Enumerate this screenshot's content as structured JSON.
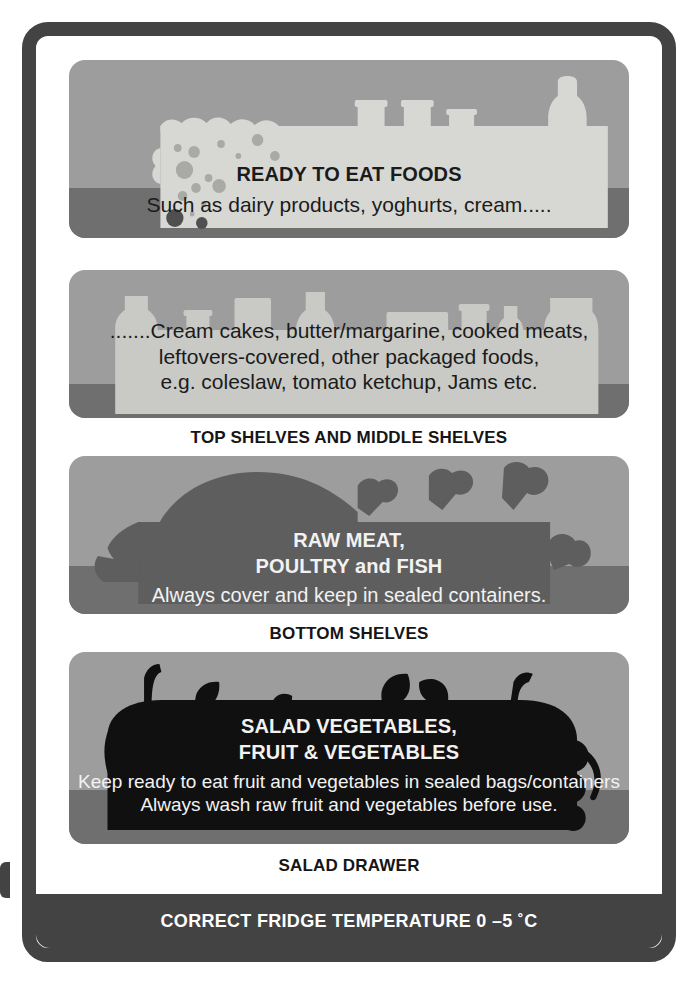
{
  "poster": {
    "title": "Fridge Food Storage Guide",
    "frame_color": "#434343",
    "panel_bg_color": "#9d9d9d",
    "panel_band_color": "#6f6f6f"
  },
  "shelves": [
    {
      "id": "ready-to-eat",
      "silhouette": "cheese-tubs-bottle",
      "silhouette_color": "#d7d8d4",
      "title": "READY TO EAT FOODS",
      "lines": [
        "Such as dairy products, yoghurts, cream....."
      ],
      "text_color": "#1b1b1b"
    },
    {
      "id": "top-middle-shelves",
      "silhouette": "bottles-jars-row",
      "silhouette_color": "#c9cac6",
      "title": "",
      "lines": [
        ".......Cream cakes, butter/margarine, cooked meats,",
        "leftovers-covered, other packaged foods,",
        "e.g. coleslaw, tomato ketchup, Jams etc."
      ],
      "text_color": "#1b1b1b",
      "caption": "TOP SHELVES AND MIDDLE SHELVES"
    },
    {
      "id": "raw-meat",
      "silhouette": "fish-and-meat-joints",
      "silhouette_color": "#5e5e5e",
      "title_lines": [
        "RAW MEAT,",
        "POULTRY and FISH"
      ],
      "lines": [
        "Always cover and keep in sealed containers."
      ],
      "text_color": "#f2f2f2",
      "caption": "BOTTOM SHELVES"
    },
    {
      "id": "salad-drawer",
      "silhouette": "fruit-and-vegetables",
      "silhouette_color": "#101010",
      "title_lines": [
        "SALAD VEGETABLES,",
        "FRUIT & VEGETABLES"
      ],
      "lines": [
        "Keep ready to eat fruit and vegetables in sealed bags/containers",
        "Always wash raw fruit and vegetables before use."
      ],
      "text_color": "#f2f2f2",
      "caption": "SALAD DRAWER"
    }
  ],
  "captions": {
    "top_middle": "TOP SHELVES AND MIDDLE SHELVES",
    "bottom": "BOTTOM SHELVES",
    "salad": "SALAD DRAWER"
  },
  "banner": {
    "text": "CORRECT FRIDGE TEMPERATURE 0 –5 ˚C",
    "background": "#434343",
    "color": "#ffffff"
  }
}
